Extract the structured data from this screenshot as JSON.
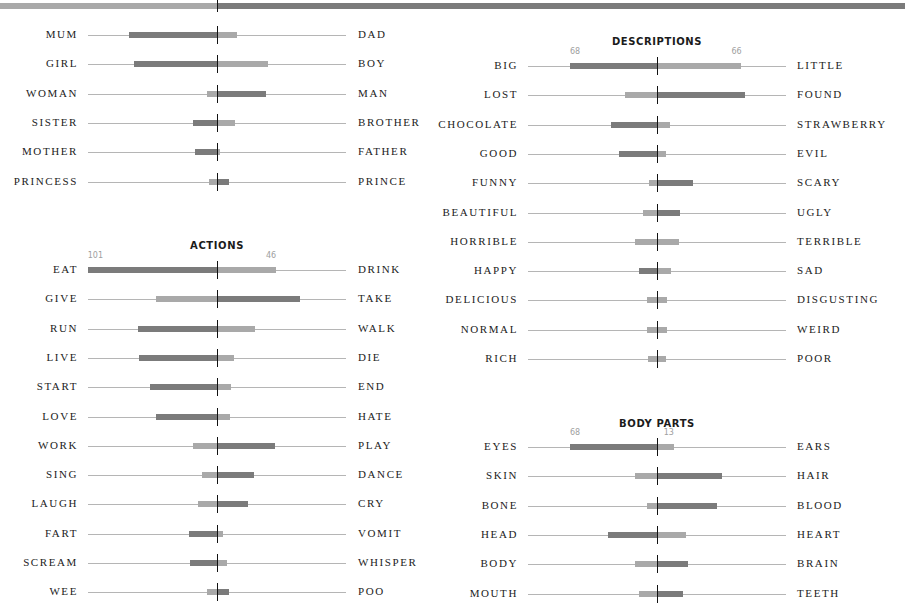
{
  "chart_data": {
    "type": "bar",
    "subtype": "diverging-paired-bar",
    "colors": {
      "dominant": "#7b7b7b",
      "minor": "#a9a9a9",
      "baseline": "#b5b5b5",
      "center_tick": "#111111"
    },
    "groups": [
      {
        "title": "",
        "rows": [
          {
            "left": "MUM",
            "right": "DAD",
            "left_value": 69,
            "right_value": 16
          },
          {
            "left": "GIRL",
            "right": "BOY",
            "left_value": 65,
            "right_value": 40
          },
          {
            "left": "WOMAN",
            "right": "MAN",
            "left_value": 8,
            "right_value": 38
          },
          {
            "left": "SISTER",
            "right": "BROTHER",
            "left_value": 19,
            "right_value": 14
          },
          {
            "left": "MOTHER",
            "right": "FATHER",
            "left_value": 17,
            "right_value": 2
          },
          {
            "left": "PRINCESS",
            "right": "PRINCE",
            "left_value": 6,
            "right_value": 9
          }
        ]
      },
      {
        "title": "ACTIONS",
        "rows": [
          {
            "left": "EAT",
            "right": "DRINK",
            "left_value": 101,
            "right_value": 46,
            "show_labels": true
          },
          {
            "left": "GIVE",
            "right": "TAKE",
            "left_value": 48,
            "right_value": 65
          },
          {
            "left": "RUN",
            "right": "WALK",
            "left_value": 62,
            "right_value": 30
          },
          {
            "left": "LIVE",
            "right": "DIE",
            "left_value": 61,
            "right_value": 13
          },
          {
            "left": "START",
            "right": "END",
            "left_value": 52,
            "right_value": 11
          },
          {
            "left": "LOVE",
            "right": "HATE",
            "left_value": 48,
            "right_value": 10
          },
          {
            "left": "WORK",
            "right": "PLAY",
            "left_value": 19,
            "right_value": 45
          },
          {
            "left": "SING",
            "right": "DANCE",
            "left_value": 12,
            "right_value": 29
          },
          {
            "left": "LAUGH",
            "right": "CRY",
            "left_value": 15,
            "right_value": 24
          },
          {
            "left": "FART",
            "right": "VOMIT",
            "left_value": 22,
            "right_value": 5
          },
          {
            "left": "SCREAM",
            "right": "WHISPER",
            "left_value": 21,
            "right_value": 8
          },
          {
            "left": "WEE",
            "right": "POO",
            "left_value": 8,
            "right_value": 9
          }
        ]
      },
      {
        "title": "DESCRIPTIONS",
        "rows": [
          {
            "left": "BIG",
            "right": "LITTLE",
            "left_value": 68,
            "right_value": 66,
            "show_labels": true
          },
          {
            "left": "LOST",
            "right": "FOUND",
            "left_value": 25,
            "right_value": 69
          },
          {
            "left": "CHOCOLATE",
            "right": "STRAWBERRY",
            "left_value": 36,
            "right_value": 10
          },
          {
            "left": "GOOD",
            "right": "EVIL",
            "left_value": 30,
            "right_value": 7
          },
          {
            "left": "FUNNY",
            "right": "SCARY",
            "left_value": 6,
            "right_value": 28
          },
          {
            "left": "BEAUTIFUL",
            "right": "UGLY",
            "left_value": 11,
            "right_value": 18
          },
          {
            "left": "HORRIBLE",
            "right": "TERRIBLE",
            "left_value": 17,
            "right_value": 17
          },
          {
            "left": "HAPPY",
            "right": "SAD",
            "left_value": 14,
            "right_value": 11
          },
          {
            "left": "DELICIOUS",
            "right": "DISGUSTING",
            "left_value": 8,
            "right_value": 8
          },
          {
            "left": "NORMAL",
            "right": "WEIRD",
            "left_value": 8,
            "right_value": 8
          },
          {
            "left": "RICH",
            "right": "POOR",
            "left_value": 7,
            "right_value": 7
          }
        ]
      },
      {
        "title": "BODY PARTS",
        "rows": [
          {
            "left": "EYES",
            "right": "EARS",
            "left_value": 68,
            "right_value": 13,
            "show_labels": true
          },
          {
            "left": "SKIN",
            "right": "HAIR",
            "left_value": 17,
            "right_value": 51
          },
          {
            "left": "BONE",
            "right": "BLOOD",
            "left_value": 8,
            "right_value": 47
          },
          {
            "left": "HEAD",
            "right": "HEART",
            "left_value": 38,
            "right_value": 23
          },
          {
            "left": "BODY",
            "right": "BRAIN",
            "left_value": 17,
            "right_value": 24
          },
          {
            "left": "MOUTH",
            "right": "TEETH",
            "left_value": 14,
            "right_value": 20
          }
        ]
      }
    ],
    "xlabel": "",
    "ylabel": "",
    "grid": false,
    "legend": null
  },
  "layout": {
    "columns": [
      {
        "center_x": 217,
        "line_left": 88,
        "line_right": 346,
        "label_right_edge": 78,
        "right_label_x": 358,
        "groups": [
          {
            "group": 0,
            "heading_y": null,
            "first_row_y": 25
          },
          {
            "group": 1,
            "heading_y": 240,
            "first_row_y": 260
          }
        ]
      },
      {
        "center_x": 657,
        "line_left": 528,
        "line_right": 786,
        "label_right_edge": 518,
        "right_label_x": 797,
        "groups": [
          {
            "group": 2,
            "heading_y": 36,
            "first_row_y": 56
          },
          {
            "group": 3,
            "heading_y": 418,
            "first_row_y": 437
          }
        ]
      }
    ],
    "row_pitch": 29.3,
    "px_per_unit": 1.28
  }
}
